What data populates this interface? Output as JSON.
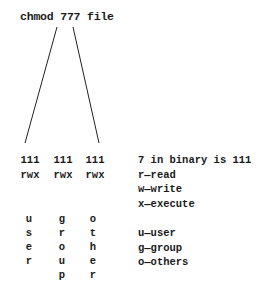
{
  "command": "chmod 777 file",
  "binary_groups": [
    {
      "bits": "111",
      "perms": "rwx",
      "who_letters": [
        "u",
        "s",
        "e",
        "r"
      ]
    },
    {
      "bits": "111",
      "perms": "rwx",
      "who_letters": [
        "g",
        "r",
        "o",
        "u",
        "p"
      ]
    },
    {
      "bits": "111",
      "perms": "rwx",
      "who_letters": [
        "o",
        "t",
        "h",
        "e",
        "r"
      ]
    }
  ],
  "legend": {
    "binary_note": "7 in binary is 111",
    "permissions": [
      "r—read",
      "w—write",
      "x—execute"
    ],
    "classes": [
      "u—user",
      "g—group",
      "o—others"
    ]
  },
  "colors": {
    "text": "#1a1a1a",
    "line": "#222222",
    "background": "#ffffff"
  }
}
